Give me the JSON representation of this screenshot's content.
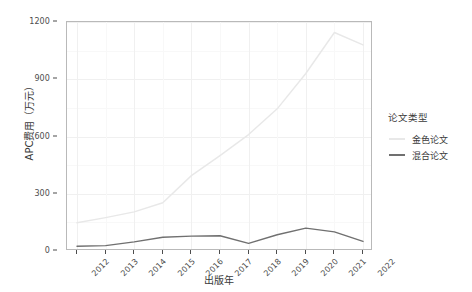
{
  "chart_data": {
    "type": "line",
    "title": "",
    "xlabel": "出版年",
    "ylabel": "APC费用（万元）",
    "x": [
      2012,
      2013,
      2014,
      2015,
      2016,
      2017,
      2018,
      2019,
      2020,
      2021,
      2022
    ],
    "categories": [
      "2012",
      "2013",
      "2014",
      "2015",
      "2016",
      "2017",
      "2018",
      "2019",
      "2020",
      "2021",
      "2022"
    ],
    "series": [
      {
        "name": "金色论文",
        "color": "#e8e8e8",
        "values": [
          148,
          175,
          205,
          253,
          395,
          500,
          610,
          745,
          930,
          1145,
          1080
        ]
      },
      {
        "name": "混合论文",
        "color": "#707070",
        "values": [
          25,
          28,
          48,
          72,
          78,
          80,
          40,
          85,
          120,
          100,
          50
        ]
      }
    ],
    "xlim": [
      2012,
      2022
    ],
    "ylim": [
      0,
      1200
    ],
    "yticks": [
      0,
      300,
      600,
      900,
      1200
    ],
    "yticklabels": [
      "0",
      "300",
      "600",
      "900",
      "1200"
    ],
    "grid": true,
    "legend": {
      "title": "论文类型",
      "position": "right",
      "entries": [
        {
          "label": "金色论文",
          "color": "#e8e8e8"
        },
        {
          "label": "混合论文",
          "color": "#707070"
        }
      ]
    },
    "panel_background": "#ffffff",
    "gridline_color": "#f0f0f0",
    "axis_text_color": "#4d4d4d"
  }
}
